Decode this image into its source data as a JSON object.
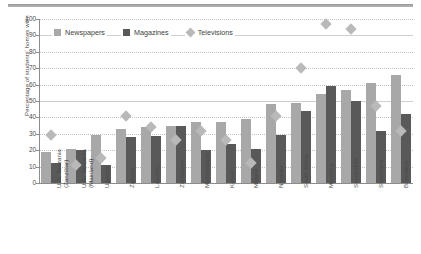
{
  "chart_data": {
    "type": "bar",
    "title": "",
    "subtitle": "",
    "xlabel": "",
    "ylabel": "Percentage of students' homes with:",
    "ylim": [
      0,
      100
    ],
    "yticks": [
      0,
      10,
      20,
      30,
      40,
      50,
      60,
      70,
      80,
      90,
      100
    ],
    "grid": true,
    "legend_position": "top-left inside plot",
    "categories": [
      "U.R. Tanzania\n(Zanzibar)",
      "U.R. Tanzania\n(Mainland)",
      "Uganda",
      "Zambia",
      "Lesotho",
      "Zimbabwe",
      "Mozambique",
      "Kenya",
      "Malawi",
      "Namibia",
      "South Africa",
      "Mauritius",
      "Seychelles",
      "Swaziland",
      "Botswana"
    ],
    "series": [
      {
        "name": "Newspapers",
        "type": "bar",
        "color": "#a8a8a8",
        "values": [
          19,
          21,
          29,
          33,
          34,
          35,
          37.5,
          37.5,
          39,
          48,
          49,
          54,
          57,
          61,
          66
        ]
      },
      {
        "name": "Magazines",
        "type": "bar",
        "color": "#595959",
        "values": [
          12.5,
          20,
          11,
          28,
          28.5,
          35,
          20,
          23.5,
          20.5,
          29,
          44,
          59,
          50,
          32,
          42
        ]
      },
      {
        "name": "Televisions",
        "type": "marker-diamond",
        "color": "#b9b9b9",
        "values": [
          29.5,
          11,
          15.5,
          41,
          34,
          26.5,
          31.5,
          26.5,
          12.5,
          41,
          70,
          97,
          94,
          47,
          32
        ]
      }
    ]
  },
  "legend": {
    "items": [
      {
        "label": "Newspapers",
        "icon": "square-swatch",
        "color": "#a8a8a8"
      },
      {
        "label": "Magazines",
        "icon": "square-swatch",
        "color": "#595959"
      },
      {
        "label": "Televisions",
        "icon": "diamond-swatch",
        "color": "#b9b9b9"
      }
    ]
  },
  "colors": {
    "newspapers": "#a8a8a8",
    "magazines": "#595959",
    "televisions": "#b9b9b9",
    "axis": "#8c8c8c",
    "grid": "#c2c2c2",
    "text": "#4a4a4a",
    "top_rule": "#9a9a9a",
    "background": "#ffffff"
  }
}
